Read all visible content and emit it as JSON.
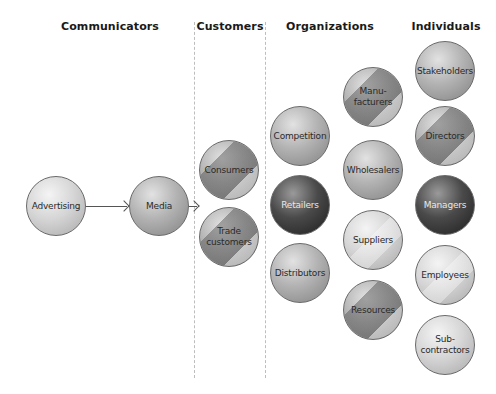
{
  "headings": {
    "communicators": "Communicators",
    "customers": "Customers",
    "organizations": "Organizations",
    "individuals": "Individuals"
  },
  "communicators": [
    {
      "label": "Advertising",
      "x": 56,
      "y": 206,
      "style": "light"
    },
    {
      "label": "Media",
      "x": 159,
      "y": 206,
      "style": "mid"
    }
  ],
  "customers": [
    {
      "label": "Consumers",
      "x": 229,
      "y": 170,
      "style": "mid-stripe"
    },
    {
      "label": "Trade\ncustomers",
      "x": 229,
      "y": 237,
      "style": "mid-stripe"
    }
  ],
  "organizations": [
    {
      "label": "Competition",
      "x": 300,
      "y": 136,
      "style": "mid"
    },
    {
      "label": "Retailers",
      "x": 300,
      "y": 205,
      "style": "dark"
    },
    {
      "label": "Distributors",
      "x": 300,
      "y": 273,
      "style": "mid"
    },
    {
      "label": "Manu-\nfacturers",
      "x": 373,
      "y": 97,
      "style": "mid-stripe"
    },
    {
      "label": "Wholesalers",
      "x": 373,
      "y": 170,
      "style": "mid"
    },
    {
      "label": "Suppliers",
      "x": 373,
      "y": 240,
      "style": "light"
    },
    {
      "label": "Resources",
      "x": 373,
      "y": 310,
      "style": "mid-stripe"
    }
  ],
  "individuals": [
    {
      "label": "Stakeholders",
      "x": 445,
      "y": 71,
      "style": "mid"
    },
    {
      "label": "Directors",
      "x": 445,
      "y": 136,
      "style": "mid-stripe"
    },
    {
      "label": "Managers",
      "x": 445,
      "y": 205,
      "style": "dark"
    },
    {
      "label": "Employees",
      "x": 445,
      "y": 275,
      "style": "light"
    },
    {
      "label": "Sub-\ncontractors",
      "x": 445,
      "y": 345,
      "style": "light"
    }
  ],
  "arrows": [
    {
      "from": "Advertising",
      "to": "Media"
    },
    {
      "from": "Media",
      "to": "Customers"
    }
  ]
}
